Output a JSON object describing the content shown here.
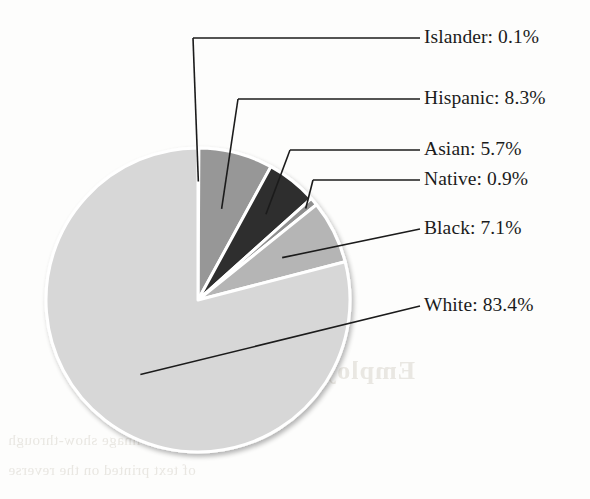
{
  "chart_data": {
    "type": "pie",
    "title": "",
    "subtitle": "",
    "xlabel": "",
    "ylabel": "",
    "legend_position": "callout-labels-right",
    "grid": false,
    "value_unit": "%",
    "start_angle_deg": 0,
    "direction": "clockwise",
    "categories": [
      "Islander",
      "Hispanic",
      "Asian",
      "Native",
      "Black",
      "White"
    ],
    "values": [
      0.1,
      8.3,
      5.7,
      0.9,
      7.1,
      83.4
    ],
    "labels": [
      "Islander: 0.1%",
      "Hispanic: 8.3%",
      "Asian: 5.7%",
      "Native: 0.9%",
      "Black: 7.1%",
      "White: 83.4%"
    ],
    "slices": [
      {
        "name": "Islander",
        "value": 0.1,
        "label": "Islander: 0.1%",
        "color": "#8f8f8f"
      },
      {
        "name": "Hispanic",
        "value": 8.3,
        "label": "Hispanic: 8.3%",
        "color": "#979797"
      },
      {
        "name": "Asian",
        "value": 5.7,
        "label": "Asian: 5.7%",
        "color": "#2e2e2e"
      },
      {
        "name": "Native",
        "value": 0.9,
        "label": "Native: 0.9%",
        "color": "#8f8f8f"
      },
      {
        "name": "Black",
        "value": 7.1,
        "label": "Black: 7.1%",
        "color": "#b5b5b5"
      },
      {
        "name": "White",
        "value": 83.4,
        "label": "White: 83.4%",
        "color": "#d7d7d7"
      }
    ],
    "colors": {
      "islander": "#8f8f8f",
      "hispanic": "#979797",
      "asian": "#2e2e2e",
      "native": "#8f8f8f",
      "black": "#b5b5b5",
      "white": "#d7d7d7",
      "slice_separator": "#ffffff",
      "leader_line": "#1b1b1b",
      "label_text": "#1b1b1b",
      "page_background": "#fdfdfc"
    }
  },
  "background_bleed": {
    "title": "Employment",
    "line1": "a mirror-image show-through",
    "line2": "of text printed on the reverse"
  }
}
